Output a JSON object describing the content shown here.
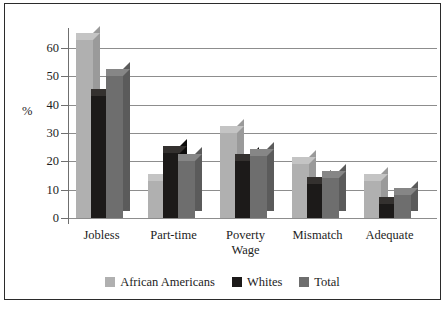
{
  "chart_data": {
    "type": "bar",
    "title": "",
    "subtitle": "",
    "xlabel": "",
    "ylabel": "%",
    "ylim": [
      0,
      65
    ],
    "ytick_labels": [
      "60",
      "50",
      "40",
      "30",
      "20",
      "10",
      "0"
    ],
    "ytick_values": [
      60,
      50,
      40,
      30,
      20,
      10,
      0
    ],
    "grid": "horizontal",
    "legend_position": "bottom-center",
    "style": "3d-grouped-bars",
    "categories": [
      "Jobless",
      "Part-time",
      "Poverty\nWage",
      "Mismatch",
      "Adequate"
    ],
    "category_labels": [
      {
        "line1": "Jobless",
        "line2": ""
      },
      {
        "line1": "Part-time",
        "line2": ""
      },
      {
        "line1": "Poverty",
        "line2": "Wage"
      },
      {
        "line1": "Mismatch",
        "line2": ""
      },
      {
        "line1": "Adequate",
        "line2": ""
      }
    ],
    "series": [
      {
        "name": "African Americans",
        "color": "#b0b0b0",
        "values": [
          63,
          13,
          30,
          19,
          13
        ]
      },
      {
        "name": "Whites",
        "color": "#1c1a19",
        "values": [
          43,
          23,
          20,
          12,
          5
        ]
      },
      {
        "name": "Total",
        "color": "#6e6e6e",
        "values": [
          50,
          20,
          22,
          14,
          8
        ]
      }
    ]
  },
  "colors": {
    "african_americans": "#b0b0b0",
    "african_americans_top": "#c4c4c4",
    "african_americans_side": "#9a9a9a",
    "whites": "#1c1a19",
    "whites_top": "#34312f",
    "whites_side": "#0e0d0c",
    "total": "#6e6e6e",
    "total_top": "#868686",
    "total_side": "#5b5b5b",
    "gridline": "#8d8d8d",
    "axis": "#6f6f6f",
    "frame": "#2b2b2b",
    "text": "#1d1d1d",
    "background": "#ffffff"
  },
  "axis": {
    "y_title": "%"
  },
  "legend": {
    "items": [
      {
        "label": "African Americans",
        "color": "#b0b0b0"
      },
      {
        "label": "Whites",
        "color": "#1c1a19"
      },
      {
        "label": "Total",
        "color": "#6e6e6e"
      }
    ]
  }
}
